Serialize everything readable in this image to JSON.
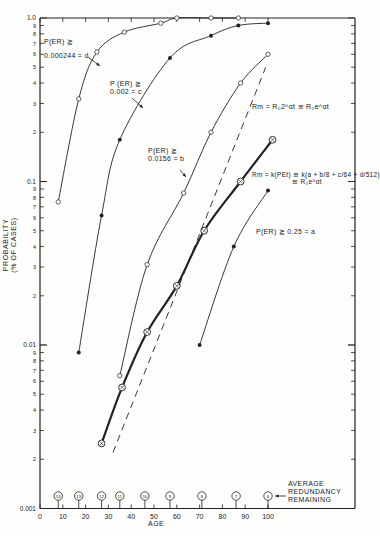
{
  "chart_data": {
    "type": "line",
    "title": "",
    "xlabel": "AGE",
    "ylabel": "PROBABILITY (% OF CASES)",
    "xlim": [
      0,
      100
    ],
    "ylim": [
      0.001,
      1.0
    ],
    "yscale": "log",
    "x_ticks": [
      0,
      10,
      20,
      30,
      40,
      50,
      60,
      70,
      80,
      90,
      100
    ],
    "y_tick_labels": [
      "0.001",
      "2",
      "3",
      "4",
      "5",
      "6",
      "7",
      "8",
      "9",
      "0.01",
      "2",
      "3",
      "4",
      "5",
      "6",
      "7",
      "8",
      "9",
      "0.1",
      "2",
      "3",
      "4",
      "5",
      "6",
      "7",
      "8",
      "9",
      "1.0"
    ],
    "grid": false,
    "series": [
      {
        "name": "P(ER) ≥ 0.000244 = d",
        "marker": "open-circle",
        "x": [
          8,
          17,
          25,
          37,
          53,
          60,
          75,
          87
        ],
        "y": [
          0.075,
          0.32,
          0.62,
          0.82,
          0.93,
          1.0,
          1.0,
          1.0
        ]
      },
      {
        "name": "P(ER) ≥ 0.002 = c",
        "marker": "filled-circle",
        "x": [
          17,
          27,
          35,
          57,
          75,
          87,
          100
        ],
        "y": [
          0.009,
          0.062,
          0.18,
          0.57,
          0.78,
          0.9,
          0.93
        ]
      },
      {
        "name": "P(ER) ≥ 0.0156 = b",
        "marker": "open-circle",
        "x": [
          35,
          47,
          63,
          75,
          88,
          100
        ],
        "y": [
          0.0065,
          0.031,
          0.085,
          0.2,
          0.4,
          0.6
        ]
      },
      {
        "name": "Rm = k(PEt) ≅ k(a + b/8 + c/64 + d/512) ≅ R0 e^αt",
        "marker": "circled-x",
        "style": "bold",
        "x": [
          27,
          36,
          47,
          60,
          72,
          88,
          102
        ],
        "y": [
          0.0025,
          0.0055,
          0.012,
          0.023,
          0.05,
          0.1,
          0.18
        ]
      },
      {
        "name": "P(ER) ≥ 0.25 = a",
        "marker": "filled-circle",
        "x": [
          70,
          85,
          100
        ],
        "y": [
          0.01,
          0.04,
          0.088
        ]
      },
      {
        "name": "Rm = R0 2^αt ≅ R0 e^αt",
        "style": "dashed",
        "x": [
          32,
          99
        ],
        "y": [
          0.0022,
          0.5
        ]
      }
    ],
    "annotations": [
      {
        "text": "AVERAGE REDUNDANCY REMAINING",
        "markers": [
          {
            "age": 8,
            "value": 14
          },
          {
            "age": 17,
            "value": 13
          },
          {
            "age": 27,
            "value": 12
          },
          {
            "age": 35,
            "value": 11
          },
          {
            "age": 46,
            "value": 10
          },
          {
            "age": 57,
            "value": 9
          },
          {
            "age": 71,
            "value": 8
          },
          {
            "age": 86,
            "value": 7
          },
          {
            "age": 100,
            "value": 6
          }
        ]
      }
    ]
  },
  "labels": {
    "d_line1": "P(ER) ≧",
    "d_line2": "0.000244 = d",
    "c_line1": "P (ER) ≧",
    "c_line2": "0.002 = c",
    "b_line1": "P(ER) ≧",
    "b_line2": "0.0156 = b",
    "a_label": "P(ER) ≧ 0.25 = a",
    "dashed_eq": "Rm = R₀2^αt ≅ R₀e^αt",
    "rm_eq_line1": "Rm = k(PEt) ≅ k(a + b/8 + c/64 + d/512)",
    "rm_eq_line2": "≅ R₀e^αt",
    "ylabel_line1": "PROBABILITY",
    "ylabel_line2": "(% OF CASES)",
    "xlabel": "AGE",
    "redundancy_line1": "AVERAGE",
    "redundancy_line2": "REDUNDANCY",
    "redundancy_line3": "REMAINING"
  },
  "colors": {
    "ink": "#222222",
    "background": "#fdfdfb"
  }
}
